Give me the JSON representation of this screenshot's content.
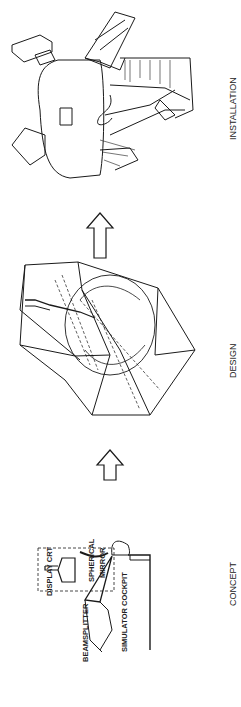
{
  "stages": [
    {
      "id": "concept",
      "label": "CONCEPT"
    },
    {
      "id": "design",
      "label": "DESIGN"
    },
    {
      "id": "installation",
      "label": "INSTALLATION"
    }
  ],
  "concept_callouts": {
    "display_crt": "DISPLAY CRT",
    "spherical_mirror_1": "SPHERICAL",
    "spherical_mirror_2": "MIRROR",
    "beamsplitter": "BEAMSPLITTER",
    "simulator_cockpit": "SIMULATOR COCKPIT"
  },
  "colors": {
    "line": "#1a1a1a",
    "background": "#ffffff"
  }
}
